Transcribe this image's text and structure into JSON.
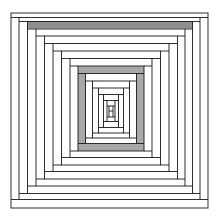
{
  "artwork": {
    "title": "Nested Rectangles Tunnel",
    "type": "line-art-illustration",
    "width": 219,
    "height": 222,
    "background_color": "#ffffff",
    "stroke_color": "#1a1a1a",
    "stroke_width": 0.9,
    "description": "Concentric nested rectangles with horizontal connector bands creating a one-point perspective tunnel illusion"
  },
  "palette": {
    "ink": "#1a1a1a",
    "paper": "#ffffff",
    "band_dark": "#8f8f8f",
    "band_mid": "#a8a8a8",
    "band_light": "#cfcfcf",
    "hairline": "#555555"
  },
  "geometry": {
    "center_x": 110.5,
    "center_y": 111.0,
    "outer_rect": {
      "x": 11,
      "y": 13,
      "width": 197,
      "height": 195
    },
    "rings": [
      {
        "index": 0,
        "x": 11.0,
        "y": 13.0,
        "width": 197.0,
        "height": 195.0
      },
      {
        "index": 1,
        "x": 19.0,
        "y": 17.5,
        "width": 181.0,
        "height": 182.0
      },
      {
        "index": 2,
        "x": 27.5,
        "y": 21.5,
        "width": 165.0,
        "height": 172.0
      },
      {
        "index": 3,
        "x": 36.0,
        "y": 29.0,
        "width": 149.0,
        "height": 157.0
      },
      {
        "index": 4,
        "x": 44.5,
        "y": 36.0,
        "width": 133.0,
        "height": 143.0
      },
      {
        "index": 5,
        "x": 53.0,
        "y": 43.5,
        "width": 116.0,
        "height": 128.0
      },
      {
        "index": 6,
        "x": 61.5,
        "y": 51.0,
        "width": 99.0,
        "height": 114.0
      },
      {
        "index": 7,
        "x": 70.0,
        "y": 58.5,
        "width": 82.0,
        "height": 99.0
      },
      {
        "index": 8,
        "x": 78.0,
        "y": 66.0,
        "width": 66.0,
        "height": 85.0
      },
      {
        "index": 9,
        "x": 85.5,
        "y": 73.5,
        "width": 51.0,
        "height": 70.0
      },
      {
        "index": 10,
        "x": 92.5,
        "y": 81.0,
        "width": 37.0,
        "height": 57.0
      },
      {
        "index": 11,
        "x": 98.5,
        "y": 88.0,
        "width": 25.0,
        "height": 45.0
      },
      {
        "index": 12,
        "x": 103.5,
        "y": 94.5,
        "width": 15.0,
        "height": 33.0
      },
      {
        "index": 13,
        "x": 107.0,
        "y": 100.5,
        "width": 8.0,
        "height": 21.0
      },
      {
        "index": 14,
        "x": 109.0,
        "y": 106.0,
        "width": 4.0,
        "height": 11.0
      }
    ],
    "shaded_bands": [
      {
        "name": "top-band-ring-1",
        "x": 27.5,
        "y": 21.0,
        "width": 165.0,
        "height": 7.5,
        "fill": "#8f8f8f"
      },
      {
        "name": "inner-ring-top",
        "x": 78.0,
        "y": 66.0,
        "width": 66.0,
        "height": 7.0,
        "fill": "#a8a8a8"
      },
      {
        "name": "inner-ring-left",
        "x": 78.0,
        "y": 66.0,
        "width": 7.5,
        "height": 85.0,
        "fill": "#a8a8a8"
      },
      {
        "name": "inner-ring-right",
        "x": 136.5,
        "y": 66.0,
        "width": 7.5,
        "height": 85.0,
        "fill": "#a8a8a8"
      },
      {
        "name": "inner-ring-bottom",
        "x": 78.0,
        "y": 144.0,
        "width": 66.0,
        "height": 7.0,
        "fill": "#a8a8a8"
      }
    ]
  },
  "labels": {
    "canvas_name": "tunnel-illustration-canvas",
    "figure_caption": ""
  }
}
